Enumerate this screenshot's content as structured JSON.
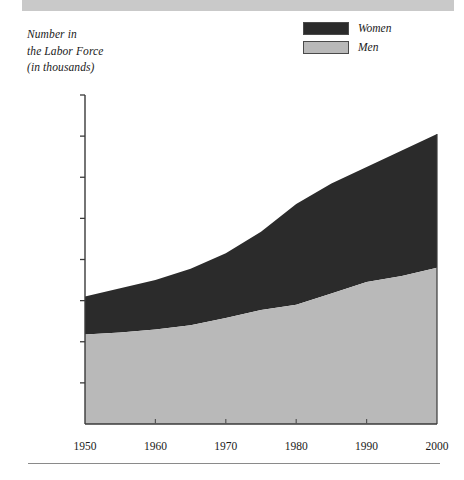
{
  "figure": {
    "y_axis_caption_lines": [
      "Number in",
      "the Labor Force",
      "(in thousands)"
    ],
    "colors": {
      "women_fill": "#2b2b2b",
      "men_fill": "#b9b9b9",
      "axis": "#3a3a3a",
      "banner": "#c9c9c9",
      "rule": "#8a8a8a",
      "background": "#ffffff"
    }
  },
  "legend": {
    "position": "top-right",
    "entries": [
      {
        "label": "Women",
        "swatch": "women-swatch",
        "color": "#2b2b2b"
      },
      {
        "label": "Men",
        "swatch": "men-swatch",
        "color": "#b9b9b9"
      }
    ]
  },
  "axes": {
    "y_tick_labels": [
      "160,000",
      "140,000",
      "120,000",
      "100,000",
      "80,000",
      "60,000",
      "40,000",
      "20,000",
      "0"
    ],
    "x_tick_labels": [
      "1950",
      "1960",
      "1970",
      "1980",
      "1990",
      "2000"
    ]
  },
  "chart_data": {
    "type": "area",
    "stacked": true,
    "title": "",
    "subtitle": "",
    "xlabel": "",
    "ylabel": "Number in the Labor Force (in thousands)",
    "xlim": [
      1950,
      2000
    ],
    "ylim": [
      0,
      160000
    ],
    "ytick_step": 20000,
    "grid": false,
    "legend_position": "top-right",
    "x": [
      1950,
      1955,
      1960,
      1965,
      1970,
      1975,
      1980,
      1985,
      1990,
      1995,
      2000
    ],
    "series": [
      {
        "name": "Men",
        "color": "#b9b9b9",
        "stack_order": 1,
        "values": [
          43500,
          44500,
          46000,
          48000,
          51500,
          55500,
          58000,
          63500,
          69000,
          72000,
          76000
        ]
      },
      {
        "name": "Women",
        "color": "#2b2b2b",
        "stack_order": 2,
        "values": [
          18500,
          21500,
          24000,
          27500,
          31500,
          38000,
          49000,
          53500,
          56000,
          61000,
          65000
        ]
      }
    ],
    "totals": [
      62000,
      66000,
      70000,
      75500,
      83000,
      93500,
      107000,
      117000,
      125000,
      133000,
      141000
    ],
    "annotations": []
  }
}
